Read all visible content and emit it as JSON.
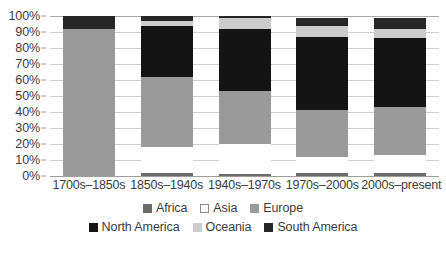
{
  "chart_data": {
    "type": "bar",
    "subtype": "stacked-100-percent",
    "title": "",
    "subtitle": "",
    "xlabel": "",
    "ylabel": "",
    "ylim": [
      0,
      100
    ],
    "grid": true,
    "legend_position": "bottom",
    "categories": [
      "1700s–1850s",
      "1850s–1940s",
      "1940s–1970s",
      "1970s–2000s",
      "2000s–present"
    ],
    "y_ticks": [
      "0%",
      "10%",
      "20%",
      "30%",
      "40%",
      "50%",
      "60%",
      "70%",
      "80%",
      "90%",
      "100%"
    ],
    "y_tick_values": [
      0,
      10,
      20,
      30,
      40,
      50,
      60,
      70,
      80,
      90,
      100
    ],
    "series": [
      {
        "name": "Africa",
        "color": "#6b6b6b",
        "values": [
          0,
          2,
          1,
          2,
          2
        ]
      },
      {
        "name": "Asia",
        "color": "#ffffff",
        "values": [
          0,
          16,
          19,
          10,
          11
        ]
      },
      {
        "name": "Europe",
        "color": "#9a9a9a",
        "values": [
          92,
          44,
          33,
          29,
          30
        ]
      },
      {
        "name": "North America",
        "color": "#141414",
        "values": [
          0,
          32,
          39,
          46,
          43
        ]
      },
      {
        "name": "Oceania",
        "color": "#cccccc",
        "values": [
          0,
          3,
          7,
          7,
          6
        ]
      },
      {
        "name": "South America",
        "color": "#262626",
        "values": [
          8,
          3,
          1,
          5,
          7
        ]
      }
    ]
  },
  "legend": {
    "rows": [
      [
        {
          "label": "Africa",
          "color": "#6b6b6b",
          "border": "#6b6b6b"
        },
        {
          "label": "Asia",
          "color": "#ffffff",
          "border": "#8a8a8a"
        },
        {
          "label": "Europe",
          "color": "#9a9a9a",
          "border": "#9a9a9a"
        }
      ],
      [
        {
          "label": "North America",
          "color": "#141414",
          "border": "#141414"
        },
        {
          "label": "Oceania",
          "color": "#cccccc",
          "border": "#cccccc"
        },
        {
          "label": "South America",
          "color": "#262626",
          "border": "#262626"
        }
      ]
    ]
  },
  "colors": {
    "background": "#ffffff",
    "gridline": "#cfcfcf",
    "axis": "#9d9d9d",
    "text": "#3c3c3c"
  }
}
